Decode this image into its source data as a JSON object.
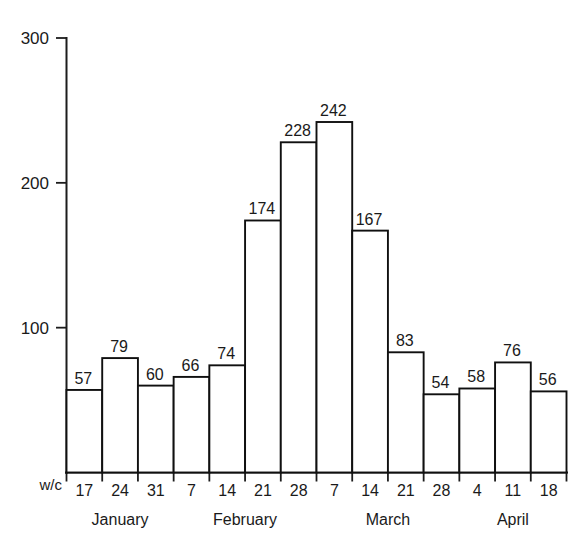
{
  "chart_data": {
    "type": "bar",
    "title": "",
    "subtitle": "",
    "xlabel": "w/c",
    "ylabel": "",
    "ylim": [
      0,
      300
    ],
    "yticks": [
      100,
      200,
      300
    ],
    "grid": false,
    "legend": null,
    "categories": [
      "17",
      "24",
      "31",
      "7",
      "14",
      "21",
      "28",
      "7",
      "14",
      "21",
      "28",
      "4",
      "11",
      "18"
    ],
    "x_tick_labels": [
      "17",
      "24",
      "31",
      "7",
      "14",
      "21",
      "28",
      "7",
      "14",
      "21",
      "28",
      "4",
      "11",
      "18"
    ],
    "values": [
      57,
      79,
      60,
      66,
      74,
      174,
      228,
      242,
      167,
      83,
      54,
      58,
      76,
      56
    ],
    "data_labels": [
      "57",
      "79",
      "60",
      "66",
      "74",
      "174",
      "228",
      "242",
      "167",
      "83",
      "54",
      "58",
      "76",
      "56"
    ],
    "bars": [
      {
        "week": "17",
        "month": "January",
        "value": 57,
        "label": "57"
      },
      {
        "week": "24",
        "month": "January",
        "value": 79,
        "label": "79"
      },
      {
        "week": "31",
        "month": "January",
        "value": 60,
        "label": "60"
      },
      {
        "week": "7",
        "month": "February",
        "value": 66,
        "label": "66"
      },
      {
        "week": "14",
        "month": "February",
        "value": 74,
        "label": "74"
      },
      {
        "week": "21",
        "month": "February",
        "value": 174,
        "label": "174"
      },
      {
        "week": "28",
        "month": "February",
        "value": 228,
        "label": "228"
      },
      {
        "week": "7",
        "month": "March",
        "value": 242,
        "label": "242"
      },
      {
        "week": "14",
        "month": "March",
        "value": 167,
        "label": "167"
      },
      {
        "week": "21",
        "month": "March",
        "value": 83,
        "label": "83"
      },
      {
        "week": "28",
        "month": "March",
        "value": 54,
        "label": "54"
      },
      {
        "week": "4",
        "month": "April",
        "value": 58,
        "label": "58"
      },
      {
        "week": "11",
        "month": "April",
        "value": 76,
        "label": "76"
      },
      {
        "week": "18",
        "month": "April",
        "value": 56,
        "label": "56"
      }
    ],
    "month_groups": [
      {
        "label": "January",
        "start_index": 0,
        "end_index": 2
      },
      {
        "label": "February",
        "start_index": 3,
        "end_index": 6
      },
      {
        "label": "March",
        "start_index": 7,
        "end_index": 10
      },
      {
        "label": "April",
        "start_index": 11,
        "end_index": 13
      }
    ],
    "colors": {
      "bar_fill": "#ffffff",
      "bar_stroke": "#101010",
      "axis": "#1c1c1c",
      "text": "#1a1a1a",
      "background": "#ffffff"
    }
  }
}
